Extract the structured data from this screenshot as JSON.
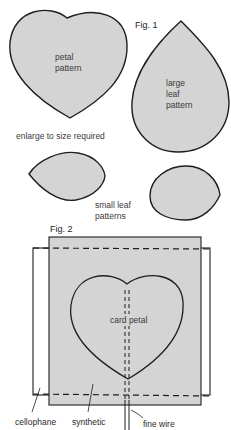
{
  "fig1": {
    "title": "Fig. 1",
    "petal_label": [
      "petal",
      "pattern"
    ],
    "large_leaf_label": [
      "large",
      "leaf",
      "pattern"
    ],
    "caption": "enlarge to size required",
    "small_leaf_label": [
      "small leaf",
      "patterns"
    ]
  },
  "fig2": {
    "title": "Fig. 2",
    "card_petal_label": "card petal",
    "callouts": {
      "cellophane": "cellophane",
      "synthetic": "synthetic",
      "fine_wire": "fine wire"
    }
  },
  "colors": {
    "shape_fill": "#d4d4d4",
    "outline": "#1e1e1e",
    "background": "#ffffff"
  }
}
